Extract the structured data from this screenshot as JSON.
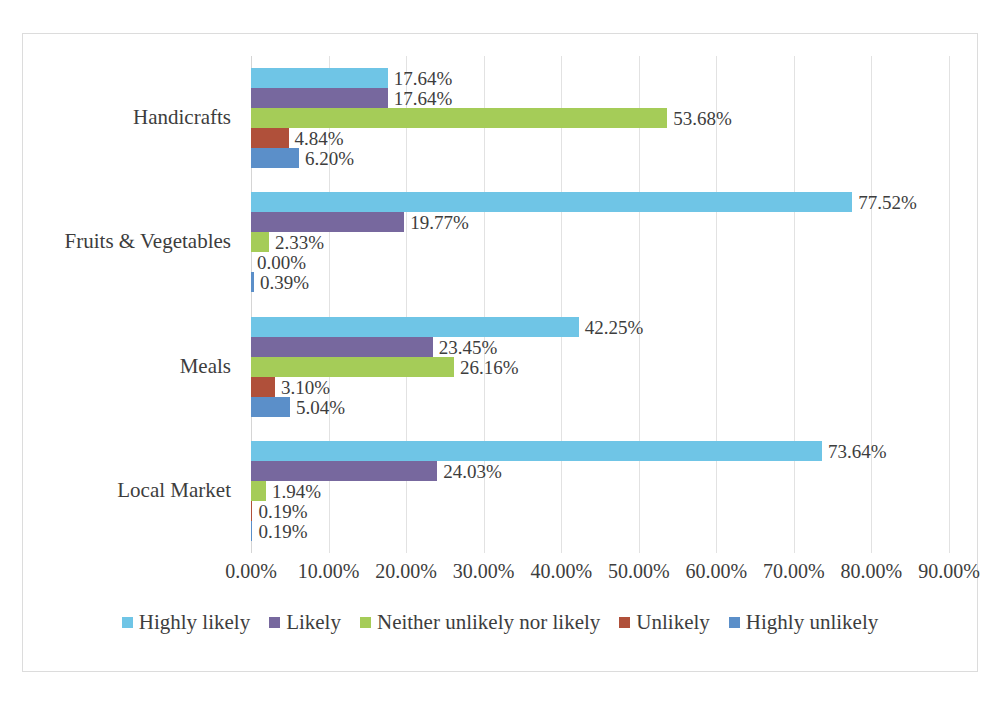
{
  "chart_data": {
    "type": "bar",
    "orientation": "horizontal",
    "title": "",
    "xlabel": "",
    "ylabel": "",
    "xlim": [
      0,
      90
    ],
    "xtick_labels": [
      "0.00%",
      "10.00%",
      "20.00%",
      "30.00%",
      "40.00%",
      "50.00%",
      "60.00%",
      "70.00%",
      "80.00%",
      "90.00%"
    ],
    "xtick_values": [
      0,
      10,
      20,
      30,
      40,
      50,
      60,
      70,
      80,
      90
    ],
    "grid": true,
    "legend_position": "bottom",
    "categories": [
      "Handicrafts",
      "Fruits & Vegetables",
      "Meals",
      "Local Market"
    ],
    "series": [
      {
        "name": "Highly likely",
        "color": "#6FC5E6",
        "values": [
          17.64,
          77.52,
          42.25,
          73.64
        ],
        "labels": [
          "17.64%",
          "77.52%",
          "42.25%",
          "73.64%"
        ]
      },
      {
        "name": "Likely",
        "color": "#77689E",
        "values": [
          17.64,
          19.77,
          23.45,
          24.03
        ],
        "labels": [
          "17.64%",
          "19.77%",
          "23.45%",
          "24.03%"
        ]
      },
      {
        "name": "Neither unlikely nor likely",
        "color": "#A5CC58",
        "values": [
          53.68,
          2.33,
          26.16,
          1.94
        ],
        "labels": [
          "53.68%",
          "2.33%",
          "26.16%",
          "1.94%"
        ]
      },
      {
        "name": "Unlikely",
        "color": "#B0503A",
        "values": [
          4.84,
          0.0,
          3.1,
          0.19
        ],
        "labels": [
          "4.84%",
          "0.00%",
          "3.10%",
          "0.19%"
        ]
      },
      {
        "name": "Highly unlikely",
        "color": "#5B8FC9",
        "values": [
          6.2,
          0.39,
          5.04,
          0.19
        ],
        "labels": [
          "6.20%",
          "0.39%",
          "5.04%",
          "0.19%"
        ]
      }
    ]
  },
  "style": {
    "frame_border": "#dcdcdc",
    "gridline": "#e2e2e2",
    "text": "#3d3d3d",
    "background": "#ffffff"
  }
}
